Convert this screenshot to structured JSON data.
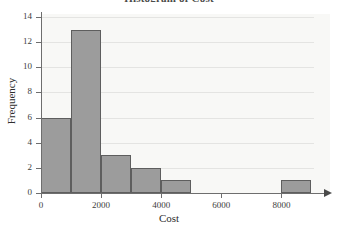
{
  "chart_data": {
    "type": "bar",
    "title": "Histogram of Cost",
    "xlabel": "Cost",
    "ylabel": "Frequency",
    "xlim": [
      0,
      9500
    ],
    "ylim": [
      0,
      14.8
    ],
    "grid": true,
    "legend": "none",
    "bin_width": 1000,
    "categories": [
      "0-1000",
      "1000-2000",
      "2000-3000",
      "3000-4000",
      "4000-5000",
      "5000-6000",
      "6000-7000",
      "7000-8000",
      "8000-9000"
    ],
    "bin_starts": [
      0,
      1000,
      2000,
      3000,
      4000,
      5000,
      6000,
      7000,
      8000
    ],
    "values": [
      6,
      13,
      3,
      2,
      1,
      0,
      0,
      0,
      1
    ],
    "xticks": [
      0,
      2000,
      4000,
      6000,
      8000
    ],
    "xtick_labels": [
      "0",
      "2000",
      "4000",
      "6000",
      "8000"
    ],
    "yticks": [
      0,
      2,
      4,
      6,
      8,
      10,
      12,
      14
    ],
    "ytick_labels": [
      "0",
      "2",
      "4",
      "6",
      "8",
      "10",
      "12",
      "14"
    ],
    "bar_color": "#9c9c9c",
    "bar_edge_color": "#5e5e5e",
    "panel_color": "#f8f8f6",
    "grid_color": "#e4e4e2",
    "axis_color": "#6e6e6e"
  }
}
